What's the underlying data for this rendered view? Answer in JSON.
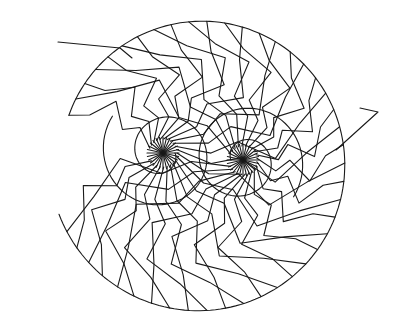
{
  "image": {
    "description": "Black line-art drawing of a spiral ammonite-like shell composed of zig-zag folded bands around two interlocking spiral centers",
    "width": 396,
    "height": 323,
    "background": "#ffffff",
    "stroke": "#1a1a1a"
  },
  "shape": {
    "outer": {
      "cx": 200,
      "cy": 163,
      "r": 150,
      "start_deg": 200,
      "end_deg": 520
    },
    "spiral_left": {
      "cx": 163,
      "cy": 153,
      "turns": 1.6,
      "r_max": 92,
      "spokes": 28
    },
    "spiral_right": {
      "cx": 243,
      "cy": 160,
      "turns": 1.6,
      "r_max": 92,
      "spokes": 28
    },
    "band_count": 44,
    "fold_amplitude": 9,
    "tail_left": [
      [
        58,
        42
      ],
      [
        120,
        48
      ],
      [
        132,
        58
      ]
    ],
    "tail_right": [
      [
        360,
        108
      ],
      [
        378,
        112
      ],
      [
        336,
        150
      ]
    ]
  },
  "caption": "Spiral shell line drawing"
}
